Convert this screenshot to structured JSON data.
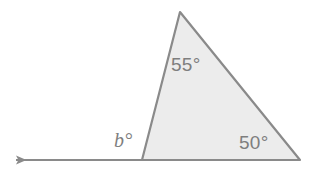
{
  "figure": {
    "kind": "geometry-diagram",
    "background_color": "#ffffff",
    "fill_color": "#ececec",
    "stroke_color": "#8a8a8a",
    "text_color": "#7e7e7e",
    "canvas": {
      "width": 314,
      "height": 187
    }
  },
  "triangle": {
    "vertices": {
      "apex": {
        "x": 180,
        "y": 12
      },
      "bottom_left": {
        "x": 142,
        "y": 160
      },
      "bottom_right": {
        "x": 300,
        "y": 160
      }
    }
  },
  "ray": {
    "from": {
      "x": 142,
      "y": 160
    },
    "to": {
      "x": 11,
      "y": 160
    },
    "arrow_direction": "left",
    "arrow_tip": {
      "x": 11,
      "y": 160
    }
  },
  "labels": {
    "apex_angle": "55°",
    "right_angle": "50°",
    "exterior_angle": "b°"
  },
  "chart_data": {
    "type": "diagram",
    "title": "",
    "annotations": [
      {
        "name": "apex-angle",
        "text": "55°",
        "value": 55,
        "unit": "degrees",
        "position": "interior-top"
      },
      {
        "name": "bottom-right-angle",
        "text": "50°",
        "value": 50,
        "unit": "degrees",
        "position": "interior-bottom-right"
      },
      {
        "name": "exterior-angle",
        "text": "b°",
        "value": null,
        "unit": "degrees",
        "position": "exterior-bottom-left"
      }
    ]
  }
}
